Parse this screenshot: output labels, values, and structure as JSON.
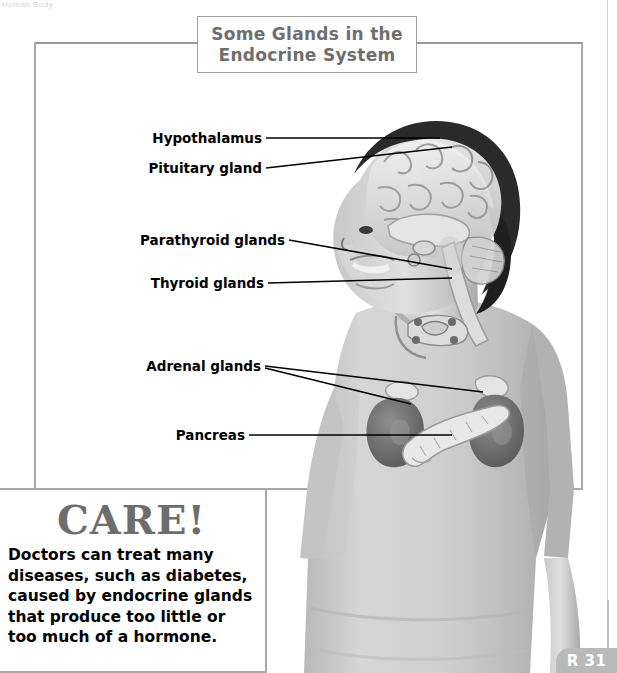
{
  "page": {
    "cut_header": "Human Body",
    "page_number": "R 31"
  },
  "title": {
    "line1": "Some Glands in the",
    "line2": "Endocrine System"
  },
  "labels": [
    {
      "id": "hypothalamus",
      "text": "Hypothalamus"
    },
    {
      "id": "pituitary-gland",
      "text": "Pituitary gland"
    },
    {
      "id": "parathyroid-glands",
      "text": "Parathyroid glands"
    },
    {
      "id": "thyroid-glands",
      "text": "Thyroid glands"
    },
    {
      "id": "adrenal-glands",
      "text": "Adrenal glands"
    },
    {
      "id": "pancreas",
      "text": "Pancreas"
    }
  ],
  "photo": {
    "description": "Boy in profile with brain, thyroid, adrenal glands and pancreas overlaid"
  },
  "care": {
    "heading": "CARE!",
    "body": "Doctors can treat many diseases, such as diabetes, caused by endocrine glands that produce too little or too much of a hormone."
  },
  "colors": {
    "frame": "#a9a9a9",
    "title_text": "#6e6e6e",
    "care_heading": "#6d6d6d",
    "page_tab": "#b9b9b9"
  }
}
